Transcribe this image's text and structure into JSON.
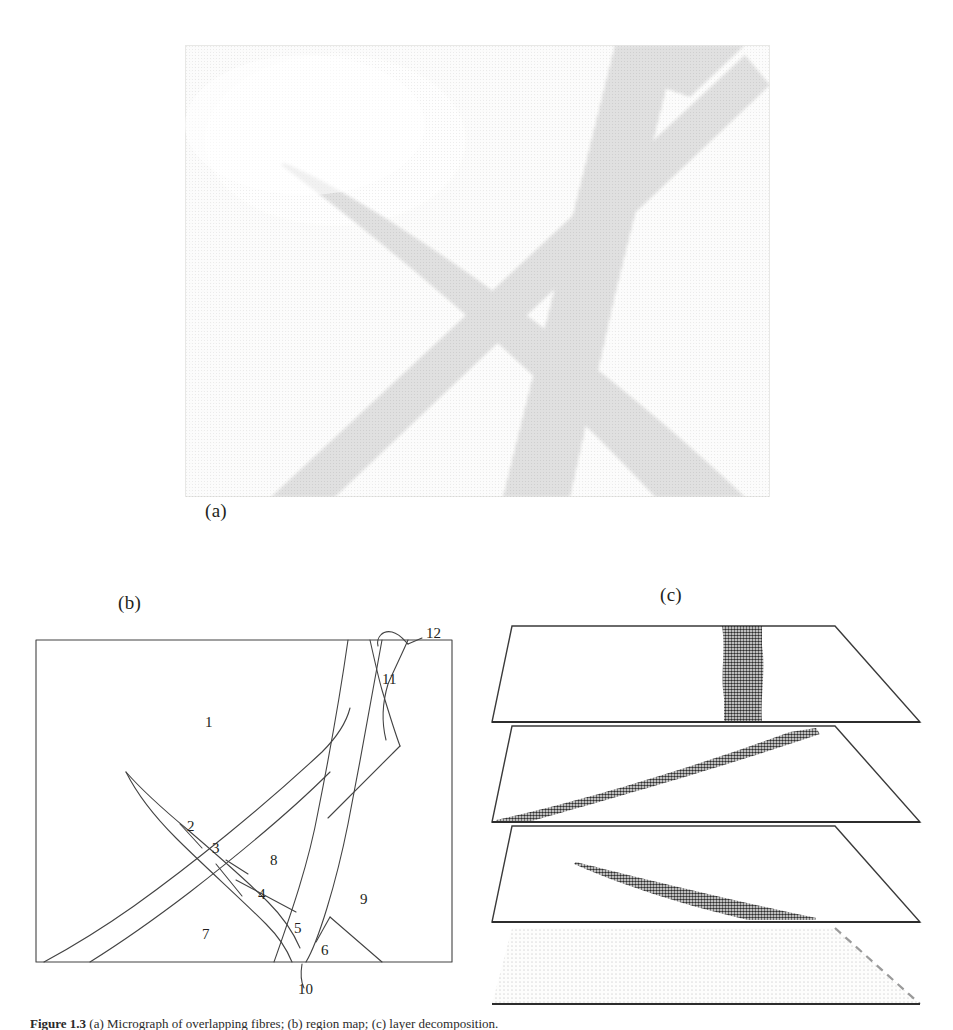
{
  "figure": {
    "panel_labels": {
      "a": "(a)",
      "b": "(b)",
      "c": "(c)"
    },
    "caption_prefix": "Figure 1.3",
    "caption_rest": " (a) Micrograph of overlapping fibres; (b) region map; (c) layer decomposition."
  },
  "panel_a": {
    "kind": "halftone-micrograph",
    "description": "Grayscale halftone photograph of three overlapping elongated fibres crossing in an X pattern over a light background",
    "background": "#f2f2f0",
    "fibre_dark": "#8a8a8a",
    "fibre_darker": "#6e6e6e",
    "border": "#d8d8d4"
  },
  "panel_b": {
    "kind": "region-map",
    "frame_color": "#404040",
    "line_color": "#404040",
    "regions": [
      {
        "id": "1",
        "label": "1",
        "x": 175,
        "y": 115
      },
      {
        "id": "2",
        "label": "2",
        "x": 157,
        "y": 219
      },
      {
        "id": "3",
        "label": "3",
        "x": 182,
        "y": 241
      },
      {
        "id": "4",
        "label": "4",
        "x": 228,
        "y": 287
      },
      {
        "id": "5",
        "label": "5",
        "x": 264,
        "y": 321
      },
      {
        "id": "6",
        "label": "6",
        "x": 291,
        "y": 343
      },
      {
        "id": "7",
        "label": "7",
        "x": 172,
        "y": 327
      },
      {
        "id": "8",
        "label": "8",
        "x": 240,
        "y": 253
      },
      {
        "id": "9",
        "label": "9",
        "x": 330,
        "y": 292
      },
      {
        "id": "10",
        "label": "10",
        "x": 278,
        "y": 382
      },
      {
        "id": "11",
        "label": "11",
        "x": 358,
        "y": 69
      },
      {
        "id": "12",
        "label": "12",
        "x": 387,
        "y": 33
      }
    ],
    "region_count": 12
  },
  "panel_c": {
    "kind": "exploded-layers",
    "outline_color": "#3a3a3a",
    "fill_dark": "#3a3a3a",
    "fill_light": "#e6e6e4",
    "layers": [
      {
        "index": 1,
        "name": "layer-vertical-band",
        "feature": "vertical dark band",
        "style": "solid-outline"
      },
      {
        "index": 2,
        "name": "layer-diagonal-band",
        "feature": "wide diagonal band rising to the right",
        "style": "solid-outline"
      },
      {
        "index": 3,
        "name": "layer-tapered-wedge",
        "feature": "thin tapering wedge descending to the right",
        "style": "solid-outline"
      },
      {
        "index": 4,
        "name": "layer-background",
        "feature": "uniform light background plane",
        "style": "dashed-right-edge"
      }
    ],
    "layer_count": 4
  }
}
